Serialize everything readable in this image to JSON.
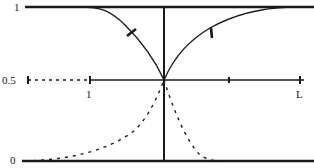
{
  "diagram": {
    "y_labels": {
      "top": "1",
      "mid": "0.5",
      "bottom": "0"
    },
    "x_labels": {
      "left": "1",
      "right": "L"
    },
    "colors": {
      "ink": "#1a1a1a",
      "background": "#ffffff"
    }
  }
}
